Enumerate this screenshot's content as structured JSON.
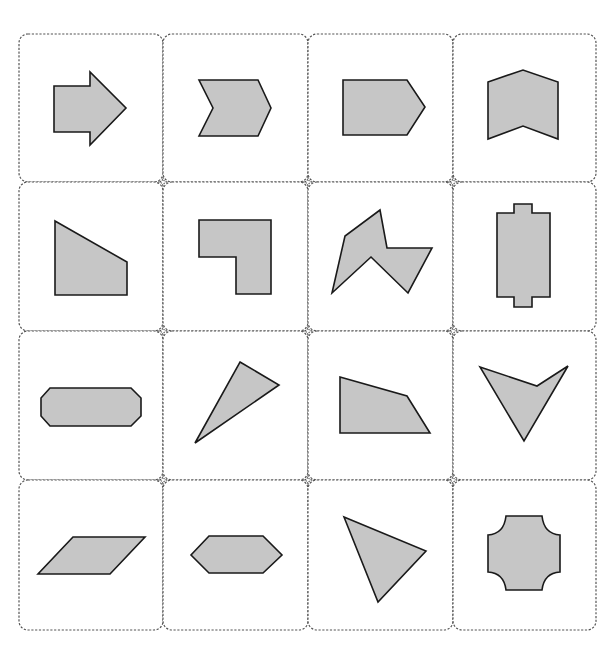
{
  "puzzle": {
    "layout": {
      "rows": 4,
      "columns": 4
    },
    "colors": {
      "shape_fill": "#c6c6c6",
      "shape_stroke": "#1a1a1a",
      "card_border": "#555555",
      "background": "#ffffff"
    },
    "cells": [
      {
        "row": 1,
        "col": 1,
        "shape": "right-arrow"
      },
      {
        "row": 1,
        "col": 2,
        "shape": "chevron-right"
      },
      {
        "row": 1,
        "col": 3,
        "shape": "pentagon-pointed-right"
      },
      {
        "row": 1,
        "col": 4,
        "shape": "chevron-up-block"
      },
      {
        "row": 2,
        "col": 1,
        "shape": "right-trapezoid-sloped-top"
      },
      {
        "row": 2,
        "col": 2,
        "shape": "l-shape"
      },
      {
        "row": 2,
        "col": 3,
        "shape": "irregular-zigzag-polygon"
      },
      {
        "row": 2,
        "col": 4,
        "shape": "tabbed-rectangle-vertical"
      },
      {
        "row": 3,
        "col": 1,
        "shape": "octagon-elongated"
      },
      {
        "row": 3,
        "col": 2,
        "shape": "thin-triangle"
      },
      {
        "row": 3,
        "col": 3,
        "shape": "irregular-quadrilateral"
      },
      {
        "row": 3,
        "col": 4,
        "shape": "concave-arrowhead-down"
      },
      {
        "row": 4,
        "col": 1,
        "shape": "parallelogram"
      },
      {
        "row": 4,
        "col": 2,
        "shape": "hexagon-elongated"
      },
      {
        "row": 4,
        "col": 3,
        "shape": "scalene-triangle"
      },
      {
        "row": 4,
        "col": 4,
        "shape": "concave-corner-cross"
      }
    ]
  }
}
